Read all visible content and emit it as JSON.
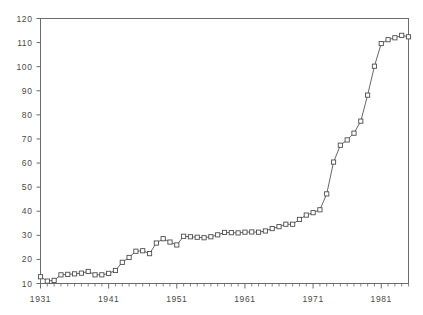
{
  "chart_data": {
    "type": "line",
    "title": "",
    "xlabel": "",
    "ylabel": "",
    "xlim": [
      1931,
      1985
    ],
    "ylim": [
      10,
      120
    ],
    "grid": false,
    "legend": null,
    "marker": "open-square",
    "x_major_ticks": [
      1931,
      1941,
      1951,
      1961,
      1971,
      1981
    ],
    "x_major_tick_labels": [
      "1931",
      "1941",
      "1951",
      "1961",
      "1971",
      "1981"
    ],
    "x_minor_tick_interval": 1,
    "y_ticks": [
      10,
      20,
      30,
      40,
      50,
      60,
      70,
      80,
      90,
      100,
      110,
      120
    ],
    "y_tick_labels": [
      "10",
      "20",
      "30",
      "40",
      "50",
      "60",
      "70",
      "80",
      "90",
      "100",
      "110",
      "120"
    ],
    "series": [
      {
        "name": "series-1",
        "x": [
          1931,
          1932,
          1933,
          1934,
          1935,
          1936,
          1937,
          1938,
          1939,
          1940,
          1941,
          1942,
          1943,
          1944,
          1945,
          1946,
          1947,
          1948,
          1949,
          1950,
          1951,
          1952,
          1953,
          1954,
          1955,
          1956,
          1957,
          1958,
          1959,
          1960,
          1961,
          1962,
          1963,
          1964,
          1965,
          1966,
          1967,
          1968,
          1969,
          1970,
          1971,
          1972,
          1973,
          1974,
          1975,
          1976,
          1977,
          1978,
          1979,
          1980,
          1981,
          1982,
          1983,
          1984,
          1985
        ],
        "values": [
          12.8,
          11.0,
          11.3,
          13.6,
          13.8,
          14.0,
          14.3,
          15.0,
          13.6,
          13.6,
          14.2,
          15.4,
          18.8,
          20.8,
          23.4,
          23.6,
          22.4,
          26.8,
          28.6,
          27.2,
          26.0,
          29.6,
          29.4,
          29.2,
          29.0,
          29.4,
          30.2,
          31.2,
          31.1,
          31.0,
          31.3,
          31.4,
          31.3,
          31.8,
          32.8,
          33.6,
          34.6,
          34.6,
          36.6,
          38.4,
          39.4,
          40.6,
          47.2,
          60.4,
          67.4,
          69.6,
          72.4,
          77.4,
          88.2,
          100.2,
          109.6,
          111.2,
          112.0,
          113.0,
          112.4
        ]
      }
    ]
  }
}
